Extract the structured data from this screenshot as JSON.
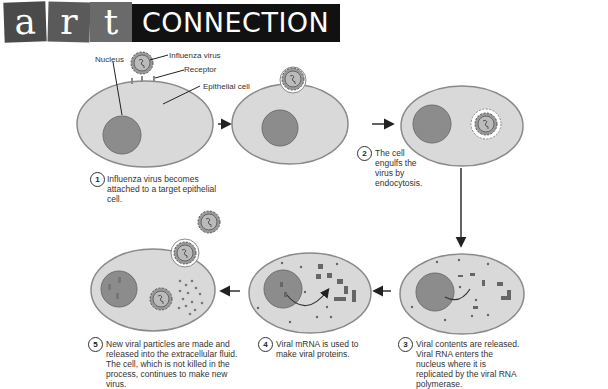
{
  "header": {
    "tiles": [
      "a",
      "r",
      "t"
    ],
    "banner": "CONNECTION"
  },
  "labels": {
    "nucleus": "Nucleus",
    "influenza_virus": "Influenza virus",
    "receptor": "Receptor",
    "epithelial_cell": "Epithelial cell"
  },
  "steps": [
    {
      "num": "1",
      "text": "Influenza virus becomes attached to a target epithelial cell."
    },
    {
      "num": "2",
      "text": "The cell engulfs the virus by endocytosis."
    },
    {
      "num": "3",
      "text": "Viral contents are released. Viral RNA enters the nucleus where it is replicated by the viral RNA polymerase."
    },
    {
      "num": "4",
      "text": "Viral mRNA is used to make viral proteins."
    },
    {
      "num": "5",
      "text": "New viral particles are made and released into the extracellular fluid. The cell, which is not killed in the process, continues to make new virus."
    }
  ],
  "colors": {
    "cell_fill": "#d9d9d9",
    "cell_stroke": "#8a8a8a",
    "nucleus_fill": "#8c8c8c",
    "nucleus_stroke": "#6e6e6e",
    "arrow": "#222222"
  }
}
